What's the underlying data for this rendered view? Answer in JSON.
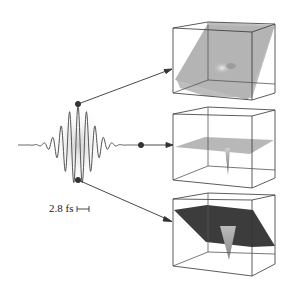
{
  "figure": {
    "scale_label": "2.8 fs",
    "panels": [
      {
        "name": "top-cube",
        "shading": "light-gray",
        "description": "tilted plane with faint central dip"
      },
      {
        "name": "middle-cube",
        "shading": "light-gray",
        "description": "horizontal plane with sharp downward spike"
      },
      {
        "name": "bottom-cube",
        "shading": "dark-gray",
        "description": "tilted dark plane with bright downward spike"
      }
    ],
    "colors": {
      "line": "#333333",
      "envelope": "#d8d8d8",
      "plane_light": "#b4b4b4",
      "plane_dark": "#3a3a3a"
    }
  }
}
